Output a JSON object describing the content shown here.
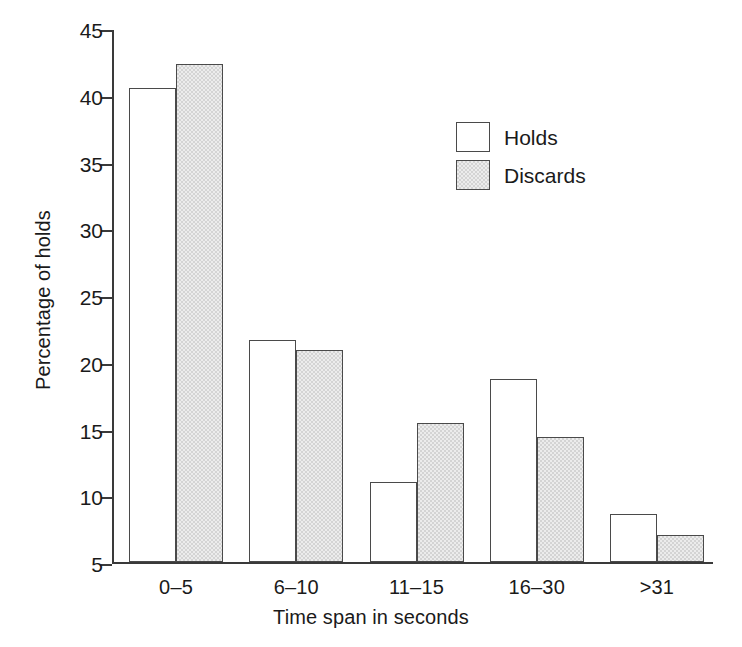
{
  "chart_data": {
    "type": "bar",
    "title": "",
    "xlabel": "Time span in seconds",
    "ylabel": "Percentage of holds",
    "categories": [
      "0–5",
      "6–10",
      "11–15",
      "16–30",
      ">31"
    ],
    "series": [
      {
        "name": "Holds",
        "values": [
          40.5,
          21.6,
          11.0,
          18.7,
          8.6
        ],
        "color": "#ffffff",
        "edge_color": "#4a4a4a"
      },
      {
        "name": "Discards",
        "values": [
          42.3,
          20.9,
          15.4,
          14.4,
          7.0
        ],
        "color": "#d4d4d4",
        "edge_color": "#4a4a4a"
      }
    ],
    "ylim": [
      5,
      45
    ],
    "yticks": [
      5,
      10,
      15,
      20,
      25,
      30,
      35,
      40,
      45
    ],
    "ytick_labels": [
      "5",
      "10",
      "15",
      "20",
      "25",
      "30",
      "35",
      "40",
      "45"
    ],
    "grid": false,
    "legend_position": "upper center",
    "legend_entries": [
      "Holds",
      "Discards"
    ]
  },
  "axes": {
    "y_title": "Percentage of holds",
    "x_title": "Time span in seconds"
  },
  "legend": {
    "items": [
      {
        "label": "Holds"
      },
      {
        "label": "Discards"
      }
    ]
  }
}
